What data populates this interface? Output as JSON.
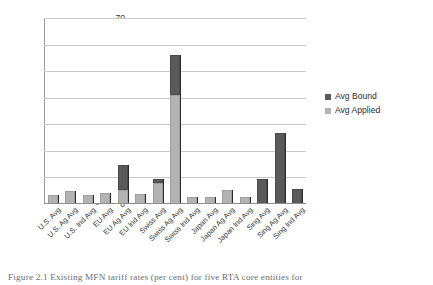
{
  "chart_data": {
    "type": "bar",
    "title": "",
    "xlabel": "",
    "ylabel": "",
    "ylim": [
      0,
      70
    ],
    "yticks": [
      0,
      10,
      20,
      30,
      40,
      50,
      60,
      70
    ],
    "grid": true,
    "stacked": true,
    "legend_position": "right",
    "categories": [
      "U.S. Avg",
      "U.S. Ag Avg",
      "U.S. Ind Avg",
      "EU Avg",
      "EU Ag Avg",
      "EU Ind Avg",
      "Swiss Avg",
      "Swiss Ag Avg",
      "Swiss Ind Avg",
      "Japan Avg",
      "Japan Ag Avg",
      "Japan Ind Avg",
      "Sing Avg",
      "Sing Ag Avg",
      "Sing Ind Avg"
    ],
    "series": [
      {
        "name": "Avg Bound",
        "color": "#5a5a5a",
        "values": [
          3.5,
          4.9,
          3.3,
          4.2,
          5.4,
          3.9,
          9.3,
          55.5,
          2.8,
          2.6,
          5.1,
          2.6,
          9.4,
          26.8,
          5.6
        ]
      },
      {
        "name": "Avg Applied",
        "color": "#b3b3b3",
        "values": [
          3.5,
          4.9,
          3.3,
          4.2,
          5.4,
          3.9,
          8.0,
          41.0,
          2.8,
          2.6,
          5.1,
          2.6,
          0.0,
          0.0,
          0.0
        ]
      }
    ],
    "bar_tops": [
      3.5,
      4.9,
      3.3,
      4.2,
      14.8,
      3.9,
      9.3,
      56.0,
      2.8,
      2.6,
      5.1,
      2.6,
      9.4,
      26.8,
      5.6
    ],
    "legend": [
      {
        "label": "Avg Bound",
        "color": "#5a5a5a"
      },
      {
        "label": "Avg Applied",
        "color": "#b3b3b3"
      }
    ]
  },
  "caption": {
    "text": "Figure 2.1 Existing MFN tariff rates (per cent) for five RTA core entities for"
  }
}
